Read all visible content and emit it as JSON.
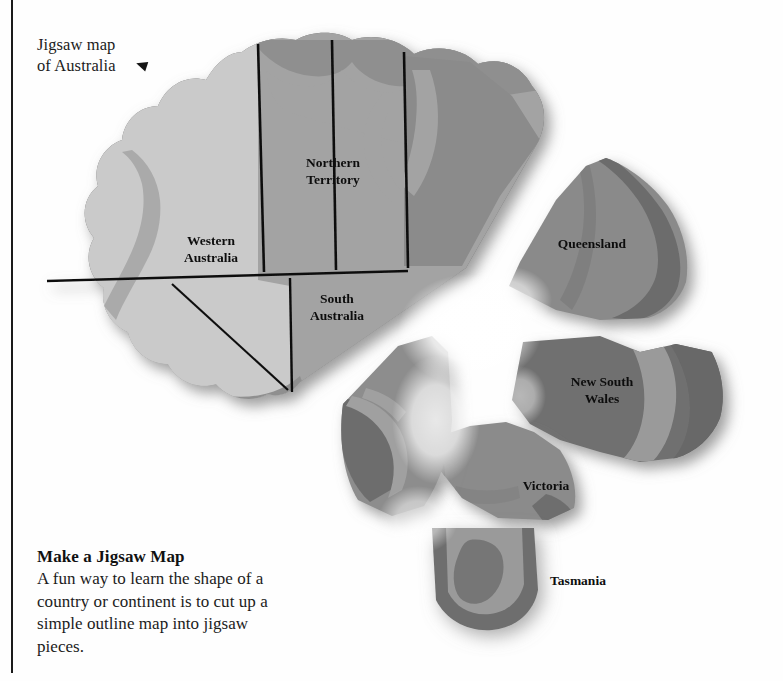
{
  "page": {
    "background_color": "#fefefe",
    "margin_rule_color": "#1a1a1a"
  },
  "caption": {
    "line1": "Jigsaw map",
    "line2": "of Australia",
    "pointer_icon": "arrow-left-triangle-icon"
  },
  "blurb": {
    "heading": "Make a Jigsaw Map",
    "line1": "A fun way to learn the shape of a",
    "line2": "country or continent is to cut up a",
    "line3": "simple outline map into jigsaw",
    "line4": "pieces."
  },
  "map": {
    "title": "Jigsaw map of Australia",
    "colors": {
      "interior_light": "#c9c9c9",
      "interior_mid": "#a0a0a0",
      "coast_band": "#8e8e8e",
      "rim_dark": "#6e6e6e",
      "piece_dark": "#707070",
      "border_line": "#111111",
      "shadow": "#9a9a9a",
      "glow": "#ffffff"
    },
    "pieces": [
      {
        "id": "mainland",
        "label": "",
        "x": 0,
        "y": 0
      },
      {
        "id": "western-australia",
        "label": "Western Australia",
        "x": 211,
        "y": 239
      },
      {
        "id": "northern-territory",
        "label": "Northern Territory",
        "x": 333,
        "y": 162
      },
      {
        "id": "south-australia",
        "label": "South Australia",
        "x": 337,
        "y": 297
      },
      {
        "id": "queensland",
        "label": "Queensland",
        "x": 592,
        "y": 243
      },
      {
        "id": "new-south-wales",
        "label": "New South Wales",
        "x": 602,
        "y": 381
      },
      {
        "id": "victoria",
        "label": "Victoria",
        "x": 546,
        "y": 485
      },
      {
        "id": "tasmania",
        "label": "Tasmania",
        "x": 578,
        "y": 580
      },
      {
        "id": "south-coast-wedge",
        "label": "",
        "x": 0,
        "y": 0
      }
    ],
    "labels": {
      "western_australia_l1": "Western",
      "western_australia_l2": "Australia",
      "northern_territory_l1": "Northern",
      "northern_territory_l2": "Territory",
      "south_australia_l1": "South",
      "south_australia_l2": "Australia",
      "queensland": "Queensland",
      "new_south_wales_l1": "New South",
      "new_south_wales_l2": "Wales",
      "victoria": "Victoria",
      "tasmania": "Tasmania"
    }
  }
}
